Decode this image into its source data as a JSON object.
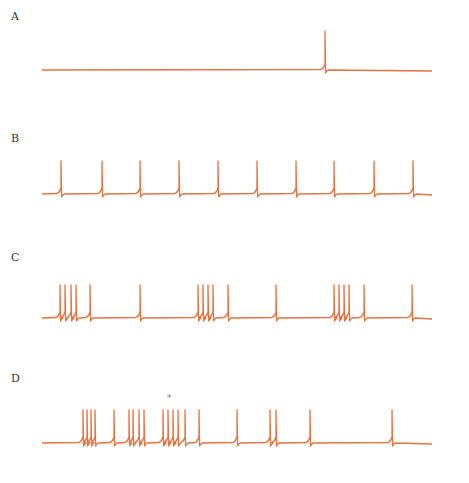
{
  "chart_data": [
    {
      "type": "line",
      "panel": "A",
      "title": "A",
      "description": "Voltage trace with a single action potential",
      "baseline_y": 70,
      "x_range": [
        42,
        432
      ],
      "spike_times_px": [
        325
      ],
      "spike_count": 1,
      "color": "#e8713f"
    },
    {
      "type": "line",
      "panel": "B",
      "title": "B",
      "description": "Regular tonic spiking",
      "baseline_y": 194,
      "x_range": [
        42,
        432
      ],
      "spike_times_px": [
        61,
        102,
        140,
        179,
        218,
        257,
        296,
        334,
        374,
        413
      ],
      "spike_count": 10,
      "color": "#e8713f"
    },
    {
      "type": "line",
      "panel": "C",
      "title": "C",
      "description": "Periodic bursting followed by single spikes",
      "baseline_y": 318,
      "x_range": [
        42,
        432
      ],
      "spike_times_px": [
        60,
        65,
        71,
        76,
        90,
        140,
        198,
        203,
        208,
        213,
        228,
        276,
        334,
        339,
        344,
        349,
        364,
        412
      ],
      "spike_count": 18,
      "color": "#e8713f"
    },
    {
      "type": "line",
      "panel": "D",
      "title": "D",
      "description": "Irregular bursting with asterisk marker",
      "baseline_y": 443,
      "x_range": [
        42,
        432
      ],
      "spike_times_px": [
        83,
        87,
        91,
        95,
        114,
        129,
        133,
        139,
        144,
        163,
        168,
        173,
        178,
        185,
        199,
        237,
        270,
        276,
        310,
        392
      ],
      "spike_count": 20,
      "annotation": "*",
      "color": "#e8713f"
    }
  ],
  "labels": {
    "a": "A",
    "b": "B",
    "c": "C",
    "d": "D",
    "asterisk": "*"
  }
}
